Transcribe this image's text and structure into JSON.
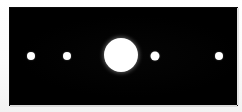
{
  "view": {
    "title": "Astronomical Observation Frame",
    "background_color": "#ffffff",
    "frame_color": "#000000",
    "object_color": "#ffffff",
    "width_px": 242,
    "height_px": 112
  },
  "frame": {
    "left_px": 10,
    "top_px": 8,
    "width_px": 227,
    "height_px": 97,
    "label": "observation-plate"
  },
  "objects": [
    {
      "id": "satellite-1",
      "label": "Satellite 1",
      "kind": "satellite",
      "x_px": 21,
      "y_px": 48,
      "diameter_px": 8,
      "color": "#ffffff"
    },
    {
      "id": "satellite-2",
      "label": "Satellite 2",
      "kind": "satellite",
      "x_px": 57,
      "y_px": 48,
      "diameter_px": 8,
      "color": "#ffffff"
    },
    {
      "id": "primary-body",
      "label": "Primary Body",
      "kind": "primary",
      "x_px": 111,
      "y_px": 47,
      "diameter_px": 34,
      "color": "#ffffff"
    },
    {
      "id": "satellite-3",
      "label": "Satellite 3",
      "kind": "satellite",
      "x_px": 145,
      "y_px": 48,
      "diameter_px": 9,
      "color": "#ffffff"
    },
    {
      "id": "satellite-4",
      "label": "Satellite 4",
      "kind": "satellite",
      "x_px": 209,
      "y_px": 48,
      "diameter_px": 8,
      "color": "#ffffff"
    }
  ]
}
